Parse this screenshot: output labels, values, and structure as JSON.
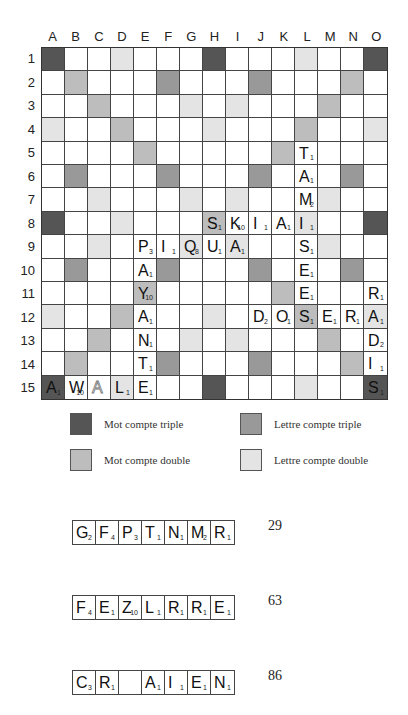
{
  "board": {
    "columns": [
      "A",
      "B",
      "C",
      "D",
      "E",
      "F",
      "G",
      "H",
      "I",
      "J",
      "K",
      "L",
      "M",
      "N",
      "O"
    ],
    "rows": [
      "1",
      "2",
      "3",
      "4",
      "5",
      "6",
      "7",
      "8",
      "9",
      "10",
      "11",
      "12",
      "13",
      "14",
      "15"
    ],
    "premium_layout": [
      [
        "MCT",
        "",
        "",
        "LCD",
        "",
        "",
        "",
        "MCT",
        "",
        "",
        "",
        "LCD",
        "",
        "",
        "MCT"
      ],
      [
        "",
        "MCD",
        "",
        "",
        "",
        "LCT",
        "",
        "",
        "",
        "LCT",
        "",
        "",
        "",
        "MCD",
        ""
      ],
      [
        "",
        "",
        "MCD",
        "",
        "",
        "",
        "LCD",
        "",
        "LCD",
        "",
        "",
        "",
        "MCD",
        "",
        ""
      ],
      [
        "LCD",
        "",
        "",
        "MCD",
        "",
        "",
        "",
        "LCD",
        "",
        "",
        "",
        "MCD",
        "",
        "",
        "LCD"
      ],
      [
        "",
        "",
        "",
        "",
        "MCD",
        "",
        "",
        "",
        "",
        "",
        "MCD",
        "",
        "",
        "",
        ""
      ],
      [
        "",
        "LCT",
        "",
        "",
        "",
        "LCT",
        "",
        "",
        "",
        "LCT",
        "",
        "",
        "",
        "LCT",
        ""
      ],
      [
        "",
        "",
        "LCD",
        "",
        "",
        "",
        "LCD",
        "",
        "LCD",
        "",
        "",
        "",
        "LCD",
        "",
        ""
      ],
      [
        "MCT",
        "",
        "",
        "LCD",
        "",
        "",
        "",
        "MCD",
        "",
        "",
        "",
        "LCD",
        "",
        "",
        "MCT"
      ],
      [
        "",
        "",
        "LCD",
        "",
        "",
        "",
        "LCD",
        "",
        "LCD",
        "",
        "",
        "",
        "LCD",
        "",
        ""
      ],
      [
        "",
        "LCT",
        "",
        "",
        "",
        "LCT",
        "",
        "",
        "",
        "LCT",
        "",
        "",
        "",
        "LCT",
        ""
      ],
      [
        "",
        "",
        "",
        "",
        "MCD",
        "",
        "",
        "",
        "",
        "",
        "MCD",
        "",
        "",
        "",
        ""
      ],
      [
        "LCD",
        "",
        "",
        "MCD",
        "",
        "",
        "",
        "LCD",
        "",
        "",
        "",
        "MCD",
        "",
        "",
        "LCD"
      ],
      [
        "",
        "",
        "MCD",
        "",
        "",
        "",
        "LCD",
        "",
        "LCD",
        "",
        "",
        "",
        "MCD",
        "",
        ""
      ],
      [
        "",
        "MCD",
        "",
        "",
        "",
        "LCT",
        "",
        "",
        "",
        "LCT",
        "",
        "",
        "",
        "MCD",
        ""
      ],
      [
        "MCT",
        "",
        "",
        "LCD",
        "",
        "",
        "",
        "MCT",
        "",
        "",
        "",
        "LCD",
        "",
        "",
        "MCT"
      ]
    ],
    "tiles": [
      {
        "col": "L",
        "row": 5,
        "letter": "T",
        "value": "1"
      },
      {
        "col": "L",
        "row": 6,
        "letter": "A",
        "value": "1"
      },
      {
        "col": "L",
        "row": 7,
        "letter": "M",
        "value": "2"
      },
      {
        "col": "H",
        "row": 8,
        "letter": "S",
        "value": "1"
      },
      {
        "col": "I",
        "row": 8,
        "letter": "K",
        "value": "10"
      },
      {
        "col": "J",
        "row": 8,
        "letter": "I",
        "value": "1"
      },
      {
        "col": "K",
        "row": 8,
        "letter": "A",
        "value": "1"
      },
      {
        "col": "L",
        "row": 8,
        "letter": "I",
        "value": "1"
      },
      {
        "col": "E",
        "row": 9,
        "letter": "P",
        "value": "3"
      },
      {
        "col": "F",
        "row": 9,
        "letter": "I",
        "value": "1"
      },
      {
        "col": "G",
        "row": 9,
        "letter": "Q",
        "value": "8"
      },
      {
        "col": "H",
        "row": 9,
        "letter": "U",
        "value": "1"
      },
      {
        "col": "I",
        "row": 9,
        "letter": "A",
        "value": "1"
      },
      {
        "col": "L",
        "row": 9,
        "letter": "S",
        "value": "1"
      },
      {
        "col": "E",
        "row": 10,
        "letter": "A",
        "value": "1"
      },
      {
        "col": "L",
        "row": 10,
        "letter": "E",
        "value": "1"
      },
      {
        "col": "E",
        "row": 11,
        "letter": "Y",
        "value": "10"
      },
      {
        "col": "L",
        "row": 11,
        "letter": "E",
        "value": "1"
      },
      {
        "col": "O",
        "row": 11,
        "letter": "R",
        "value": "1"
      },
      {
        "col": "E",
        "row": 12,
        "letter": "A",
        "value": "1"
      },
      {
        "col": "J",
        "row": 12,
        "letter": "D",
        "value": "2"
      },
      {
        "col": "K",
        "row": 12,
        "letter": "O",
        "value": "1"
      },
      {
        "col": "L",
        "row": 12,
        "letter": "S",
        "value": "1"
      },
      {
        "col": "M",
        "row": 12,
        "letter": "E",
        "value": "1"
      },
      {
        "col": "N",
        "row": 12,
        "letter": "R",
        "value": "1"
      },
      {
        "col": "O",
        "row": 12,
        "letter": "A",
        "value": "1"
      },
      {
        "col": "E",
        "row": 13,
        "letter": "N",
        "value": "1"
      },
      {
        "col": "O",
        "row": 13,
        "letter": "D",
        "value": "2"
      },
      {
        "col": "E",
        "row": 14,
        "letter": "T",
        "value": "1"
      },
      {
        "col": "O",
        "row": 14,
        "letter": "I",
        "value": "1"
      },
      {
        "col": "A",
        "row": 15,
        "letter": "A",
        "value": "1"
      },
      {
        "col": "B",
        "row": 15,
        "letter": "W",
        "value": "10"
      },
      {
        "col": "C",
        "row": 15,
        "letter": "A",
        "value": "",
        "blank": true
      },
      {
        "col": "D",
        "row": 15,
        "letter": "L",
        "value": "1"
      },
      {
        "col": "E",
        "row": 15,
        "letter": "E",
        "value": "1"
      },
      {
        "col": "O",
        "row": 15,
        "letter": "S",
        "value": "1"
      }
    ]
  },
  "colors": {
    "MCT": "#555555",
    "LCT": "#999999",
    "MCD": "#bdbdbd",
    "LCD": "#e4e4e4"
  },
  "legend": {
    "mct_label": "Mot compte triple",
    "lct_label": "Lettre compte triple",
    "mcd_label": "Mot compte double",
    "lcd_label": "Lettre compte double"
  },
  "racks": [
    {
      "tiles": [
        {
          "letter": "G",
          "value": "2"
        },
        {
          "letter": "F",
          "value": "4"
        },
        {
          "letter": "P",
          "value": "3"
        },
        {
          "letter": "T",
          "value": "1"
        },
        {
          "letter": "N",
          "value": "1"
        },
        {
          "letter": "M",
          "value": "2"
        },
        {
          "letter": "R",
          "value": "1"
        }
      ],
      "score": "29"
    },
    {
      "tiles": [
        {
          "letter": "F",
          "value": "4"
        },
        {
          "letter": "E",
          "value": "1"
        },
        {
          "letter": "Z",
          "value": "10"
        },
        {
          "letter": "L",
          "value": "1"
        },
        {
          "letter": "R",
          "value": "1"
        },
        {
          "letter": "R",
          "value": "1"
        },
        {
          "letter": "E",
          "value": "1"
        }
      ],
      "score": "63"
    },
    {
      "tiles": [
        {
          "letter": "C",
          "value": "3"
        },
        {
          "letter": "R",
          "value": "1"
        },
        {
          "letter": "",
          "value": ""
        },
        {
          "letter": "A",
          "value": "1"
        },
        {
          "letter": "I",
          "value": "1"
        },
        {
          "letter": "E",
          "value": "1"
        },
        {
          "letter": "N",
          "value": "1"
        }
      ],
      "score": "86"
    }
  ]
}
